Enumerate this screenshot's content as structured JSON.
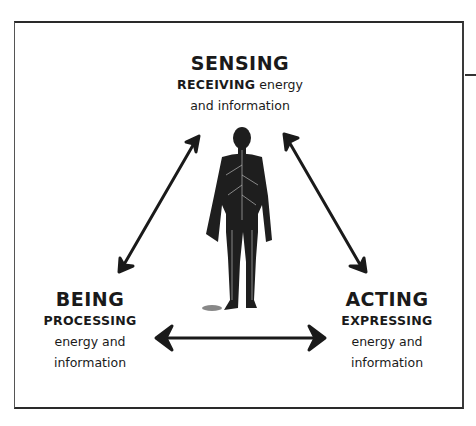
{
  "diagram": {
    "type": "triangle-cycle",
    "center_figure": "human-nervous-system-back-view",
    "nodes": [
      {
        "id": "sensing",
        "title": "SENSING",
        "lines": [
          "RECEIVING energy",
          "and information"
        ],
        "caps": "RECEIVING",
        "rest": " energy",
        "line2": "and information"
      },
      {
        "id": "being",
        "title": "BEING",
        "lines": [
          "PROCESSING",
          "energy and",
          "information"
        ],
        "caps": "PROCESSING",
        "line2": "energy and",
        "line3": "information"
      },
      {
        "id": "acting",
        "title": "ACTING",
        "lines": [
          "EXPRESSING",
          "energy and",
          "information"
        ],
        "caps": "EXPRESSING",
        "line2": "energy and",
        "line3": "information"
      }
    ],
    "edges": [
      {
        "from": "sensing",
        "to": "being",
        "style": "double-arrow"
      },
      {
        "from": "sensing",
        "to": "acting",
        "style": "double-arrow"
      },
      {
        "from": "being",
        "to": "acting",
        "style": "double-arrow"
      }
    ],
    "colors": {
      "ink": "#1a1a1a",
      "background": "#ffffff"
    }
  }
}
